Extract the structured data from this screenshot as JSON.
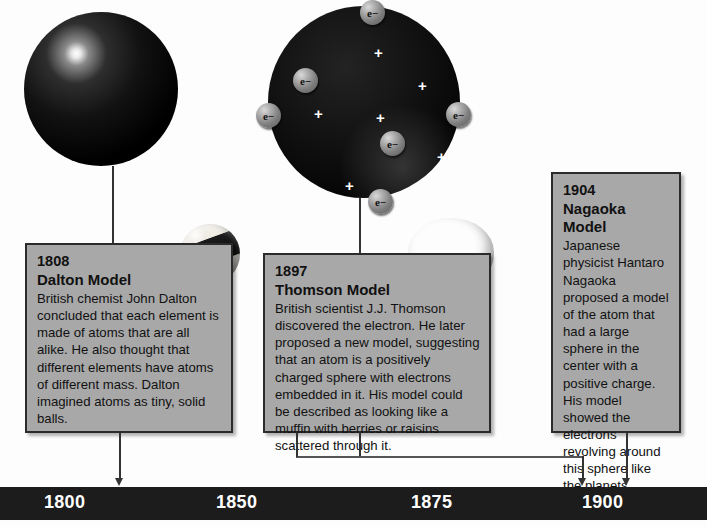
{
  "illustrations": [
    {
      "name": "dalton-solid-sphere",
      "caption": "solid black sphere (Dalton's solid ball atom)"
    },
    {
      "name": "thomson-plum-pudding-sphere",
      "caption": "dark sphere with embedded electrons and plus charges"
    },
    {
      "name": "billiard-ball-photo",
      "caption": "billiard ball photo"
    },
    {
      "name": "muffin-photo",
      "caption": "muffin with berries photo"
    }
  ],
  "thomson_atom": {
    "electron_label": "e−",
    "electron_count": 6,
    "plus_label": "+",
    "plus_count": 6,
    "electrons": [
      {
        "x": 92,
        "y": -6
      },
      {
        "x": 25,
        "y": 62
      },
      {
        "x": -12,
        "y": 97
      },
      {
        "x": 178,
        "y": 96
      },
      {
        "x": 112,
        "y": 125
      },
      {
        "x": 100,
        "y": 183
      }
    ],
    "pluses": [
      {
        "x": 106,
        "y": 39
      },
      {
        "x": 150,
        "y": 72
      },
      {
        "x": 46,
        "y": 100
      },
      {
        "x": 108,
        "y": 104
      },
      {
        "x": 169,
        "y": 143
      },
      {
        "x": 77,
        "y": 172
      }
    ]
  },
  "entries": [
    {
      "id": "dalton",
      "year": "1808",
      "title": "Dalton Model",
      "body": "British chemist John Dalton concluded that each element is made of atoms that are all alike. He also thought that different elements have atoms of different mass. Dalton imagined atoms as tiny, solid balls."
    },
    {
      "id": "thomson",
      "year": "1897",
      "title": "Thomson Model",
      "body": "British scientist J.J. Thomson discovered the electron. He later proposed a new model, suggesting that an atom is a positively charged sphere with electrons embedded in it. His model could be described as looking like a muffin with berries or raisins scattered through it."
    },
    {
      "id": "nagaoka",
      "year": "1904",
      "title": "Nagaoka Model",
      "body": "Japanese physicist Hantaro Nagaoka proposed a model of the atom that had a large sphere in the center with a positive charge. His model showed the electrons revolving around this sphere like the planets around the sun."
    }
  ],
  "timeline": {
    "bar_color": "#1c1c1c",
    "label_color": "#ffffff",
    "ticks": [
      {
        "label": "1800",
        "x": 44
      },
      {
        "label": "1850",
        "x": 216
      },
      {
        "label": "1875",
        "x": 411
      },
      {
        "label": "1900",
        "x": 582
      }
    ],
    "markers": [
      {
        "entry": "dalton",
        "x": 120
      },
      {
        "entry": "thomson",
        "x": 583
      },
      {
        "entry": "nagaoka",
        "x": 627
      }
    ]
  }
}
